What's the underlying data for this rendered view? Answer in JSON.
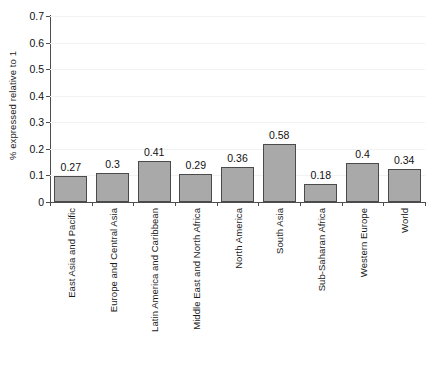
{
  "chart_data": {
    "type": "bar",
    "title": "",
    "subtitle": "",
    "xlabel": "",
    "ylabel": "% expressed relative to 1",
    "ylim": [
      0,
      0.7
    ],
    "ytick_labels": [
      "0",
      "0.1",
      "0.2",
      "0.3",
      "0.4",
      "0.5",
      "0.6",
      "0.7"
    ],
    "ytick_values": [
      0,
      0.1,
      0.2,
      0.3,
      0.4,
      0.5,
      0.6,
      0.7
    ],
    "grid": true,
    "legend": false,
    "legend_position": "none",
    "bar_color": "#a9a9a9",
    "bar_edge_color": "#4a4a4a",
    "categories": [
      "East Asia and Pacific",
      "Europe and Central Asia",
      "Latin America and Caribbean",
      "Middle East and North Africa",
      "North America",
      "South Asia",
      "Sub-Saharan Africa",
      "Western Europe",
      "World"
    ],
    "values": [
      0.098,
      0.11,
      0.155,
      0.107,
      0.133,
      0.219,
      0.068,
      0.147,
      0.124
    ],
    "data_labels": [
      "0.27",
      "0.3",
      "0.41",
      "0.29",
      "0.36",
      "0.58",
      "0.18",
      "0.4",
      "0.34"
    ]
  }
}
